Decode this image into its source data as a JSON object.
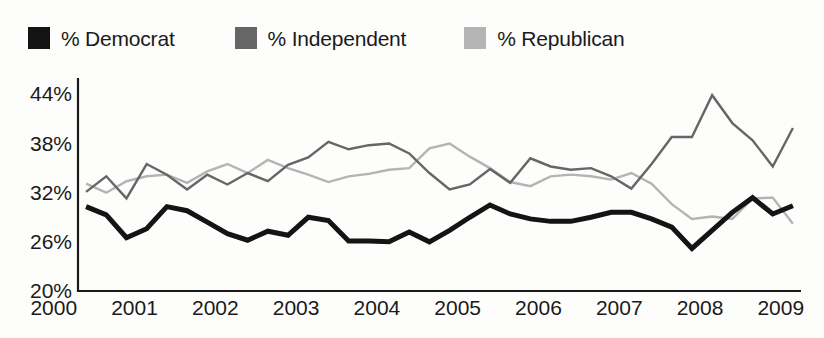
{
  "chart_data": {
    "type": "line",
    "title": "",
    "xlabel": "",
    "ylabel": "",
    "xlim": [
      2000.3,
      2009.25
    ],
    "ylim": [
      20,
      46
    ],
    "yticks": [
      "20%",
      "26%",
      "32%",
      "38%",
      "44%"
    ],
    "ytick_values": [
      20,
      26,
      32,
      38,
      44
    ],
    "xticks": [
      "2000",
      "2001",
      "2002",
      "2003",
      "2004",
      "2005",
      "2006",
      "2007",
      "2008",
      "2009"
    ],
    "xtick_values": [
      2000,
      2001,
      2002,
      2003,
      2004,
      2005,
      2006,
      2007,
      2008,
      2009
    ],
    "grid": false,
    "legend_position": "top-left",
    "x": [
      2000.4,
      2000.65,
      2000.9,
      2001.15,
      2001.4,
      2001.65,
      2001.9,
      2002.15,
      2002.4,
      2002.65,
      2002.9,
      2003.15,
      2003.4,
      2003.65,
      2003.9,
      2004.15,
      2004.4,
      2004.65,
      2004.9,
      2005.15,
      2005.4,
      2005.65,
      2005.9,
      2006.15,
      2006.4,
      2006.65,
      2006.9,
      2007.15,
      2007.4,
      2007.65,
      2007.9,
      2008.15,
      2008.4,
      2008.65,
      2008.9,
      2009.15
    ],
    "series": [
      {
        "name": "% Democrat",
        "color": "#141414",
        "width": 5,
        "values": [
          30.3,
          29.3,
          26.5,
          27.6,
          30.3,
          29.8,
          28.4,
          27.0,
          26.2,
          27.3,
          26.8,
          29.0,
          28.6,
          26.1,
          26.1,
          26.0,
          27.2,
          26.0,
          27.4,
          29.0,
          30.5,
          29.4,
          28.8,
          28.5,
          28.5,
          29.0,
          29.6,
          29.6,
          28.8,
          27.8,
          25.2,
          27.4,
          29.6,
          31.4,
          29.4,
          30.4
        ]
      },
      {
        "name": "% Independent",
        "color": "#666666",
        "width": 2.4,
        "values": [
          32.1,
          34.0,
          31.3,
          35.5,
          34.2,
          32.4,
          34.2,
          33.0,
          34.4,
          33.4,
          35.4,
          36.3,
          38.2,
          37.3,
          37.8,
          38.0,
          36.8,
          34.4,
          32.4,
          33.0,
          34.9,
          33.2,
          36.2,
          35.2,
          34.8,
          35.0,
          34.0,
          32.5,
          35.5,
          38.8,
          38.8,
          43.9,
          40.5,
          38.4,
          35.2,
          39.9
        ]
      },
      {
        "name": "% Republican",
        "color": "#b4b4b4",
        "width": 2.4,
        "values": [
          33.1,
          32.0,
          33.4,
          34.0,
          34.2,
          33.2,
          34.6,
          35.5,
          34.4,
          36.0,
          35.0,
          34.2,
          33.3,
          34.0,
          34.3,
          34.8,
          35.0,
          37.4,
          38.0,
          36.4,
          35.0,
          33.3,
          32.8,
          34.0,
          34.2,
          34.0,
          33.6,
          34.4,
          33.1,
          30.6,
          28.8,
          29.1,
          28.8,
          31.3,
          31.4,
          28.2
        ]
      }
    ]
  },
  "legend": {
    "items": [
      {
        "label": "% Democrat",
        "color": "#141414",
        "swatch": "legend-swatch-democrat"
      },
      {
        "label": "% Independent",
        "color": "#666666",
        "swatch": "legend-swatch-independent"
      },
      {
        "label": "% Republican",
        "color": "#b4b4b4",
        "swatch": "legend-swatch-republican"
      }
    ]
  },
  "axis": {
    "line_color": "#1a1a1a"
  }
}
